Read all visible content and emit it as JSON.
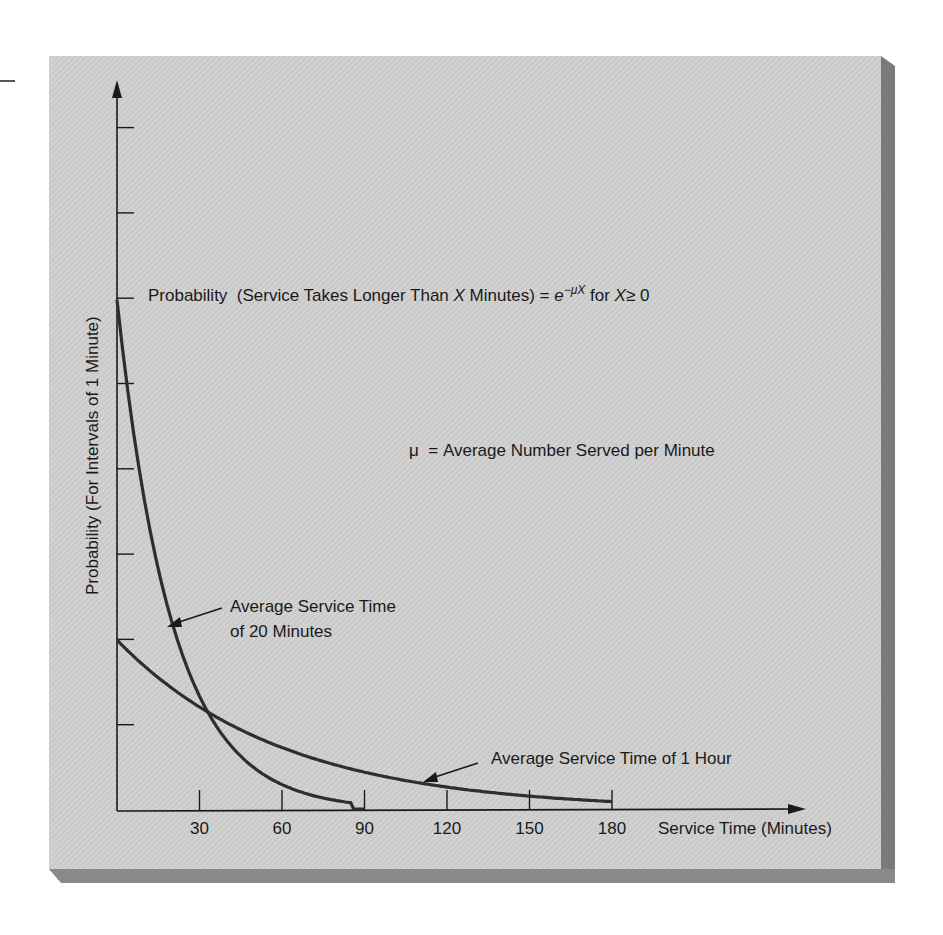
{
  "chart_data": {
    "type": "line",
    "formula": {
      "prefix": "Probability  (Service Takes Longer Than ",
      "var": "X",
      "middle": " Minutes) = ",
      "base": "e",
      "exponent": "−μX",
      "suffix_for": " for ",
      "cond_var": "X",
      "cond_rest": "≥ 0"
    },
    "definition": "μ  = Average Number Served per Minute",
    "xlabel": "Service Time (Minutes)",
    "ylabel": "Probability (For Intervals of 1 Minute)",
    "x_ticks": [
      30,
      60,
      90,
      120,
      150,
      180
    ],
    "x_tick_labels": [
      "30",
      "60",
      "90",
      "120",
      "150",
      "180"
    ],
    "y_tick_count": 8,
    "y_tick_labels": [],
    "xlim": [
      0,
      250
    ],
    "grid": false,
    "legend": null,
    "series": [
      {
        "name": "Average Service Time of 20 Minutes",
        "mu": 0.05,
        "relative_start_height": 3,
        "x": [
          0,
          10,
          20,
          30,
          40,
          50,
          60,
          70,
          80,
          90
        ],
        "values": [
          3.0,
          1.82,
          1.1,
          0.67,
          0.41,
          0.25,
          0.15,
          0.09,
          0.05,
          0.03
        ]
      },
      {
        "name": "Average Service Time of 1 Hour",
        "mu": 0.0167,
        "relative_start_height": 1,
        "x": [
          0,
          30,
          60,
          90,
          120,
          150,
          180
        ],
        "values": [
          1.0,
          0.61,
          0.37,
          0.22,
          0.14,
          0.08,
          0.05
        ]
      }
    ],
    "annotations": [
      {
        "text_line1": "Average Service Time",
        "text_line2": "of 20 Minutes",
        "points_to": "Average Service Time of 20 Minutes"
      },
      {
        "text_line1": "Average Service Time of 1 Hour",
        "points_to": "Average Service Time of 1 Hour"
      }
    ]
  },
  "colors": {
    "panel": "#cfcfcf",
    "shadow": "#7a7a7a",
    "curve": "#2e2e2e",
    "axis": "#1a1a1a"
  }
}
